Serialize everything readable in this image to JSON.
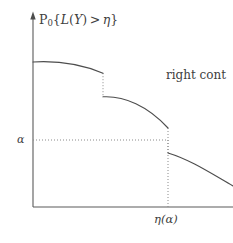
{
  "figure": {
    "type": "survival-function-plot",
    "background_color": "#ffffff",
    "ink_color": "#4d4d4d",
    "width": 233,
    "height": 243
  },
  "axes": {
    "y_axis": {
      "label_text": "P0{L(Y) > η}",
      "label_parts": {
        "prefix_upright": "P",
        "subscript": "0",
        "open_brace": "{",
        "function": "L",
        "arg_open": "(",
        "arg": "Y",
        "arg_close": ")",
        "relation": ">",
        "threshold": "η",
        "close_brace": "}"
      },
      "has_arrow": true,
      "x_px": 33,
      "top_px": 14,
      "bottom_px": 207
    },
    "x_axis": {
      "label_text": "η(α)",
      "label_parts": {
        "eta": "η",
        "open": "(",
        "alpha": "α",
        "close": ")"
      },
      "has_arrow": false,
      "y_px": 207,
      "left_px": 33,
      "right_px": 233
    },
    "alpha_tick": {
      "label_text": "α",
      "y_px": 140
    }
  },
  "annotations": [
    {
      "name": "right-continuity-note",
      "text": "right cont",
      "clipped_at_right_edge": true
    }
  ],
  "chart_data": {
    "type": "line",
    "title": "",
    "subtitle": "",
    "xlabel": "η(α)",
    "ylabel": "P0{L(Y) > η}",
    "grid": false,
    "legend": "none",
    "xlim": [
      33,
      233
    ],
    "ylim": [
      207,
      14
    ],
    "alpha_level_y": 140,
    "eta_alpha_x": 168,
    "segments": [
      {
        "name": "segment-1",
        "path": "M 33 62 C 58 60.5, 82 64.5, 103 73.2",
        "start": [
          33,
          62
        ],
        "end": [
          103,
          73.2
        ],
        "closed_left_endpoint": true,
        "open_right_endpoint": true
      },
      {
        "name": "segment-2",
        "path": "M 103 96.8 C 124 95.6, 148 106, 168 128",
        "start": [
          103,
          96.8
        ],
        "end": [
          168,
          128
        ],
        "closed_left_endpoint": true,
        "open_right_endpoint": true
      },
      {
        "name": "segment-3",
        "path": "M 168 153 C 190 159.5, 212 174, 233 186",
        "start": [
          168,
          153
        ],
        "end": [
          233,
          186
        ],
        "closed_left_endpoint": true,
        "clipped_at_right_edge": true
      }
    ],
    "jumps": [
      {
        "name": "jump-1",
        "x": 103,
        "y_from": 73.2,
        "y_to": 96.8,
        "style": "dotted"
      },
      {
        "name": "jump-2",
        "x": 168,
        "y_from": 128,
        "y_to": 153,
        "style": "dotted"
      }
    ],
    "guide_lines": [
      {
        "name": "alpha-horizontal-guide",
        "orientation": "horizontal",
        "y": 140,
        "x_from": 33,
        "x_to": 168,
        "style": "dotted"
      },
      {
        "name": "eta-alpha-vertical-guide",
        "orientation": "vertical",
        "x": 168,
        "y_from": 140,
        "y_to": 207,
        "style": "dotted"
      }
    ]
  }
}
